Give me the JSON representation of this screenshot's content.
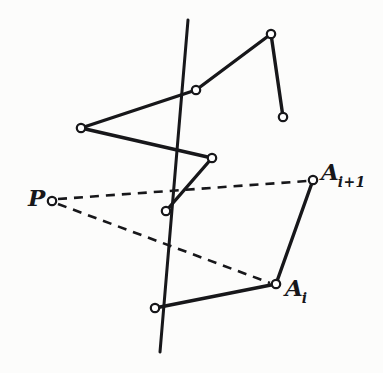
{
  "figure": {
    "kind": "geometric-diagram",
    "title": "",
    "background_color": "#fcfcfb",
    "ink_color": "#17171a",
    "marker_fill_color": "#ffffff",
    "width": 383,
    "height": 373,
    "labels": [
      {
        "id": "P",
        "base": "P",
        "subscript": "",
        "x": 28,
        "y": 186
      },
      {
        "id": "Ai",
        "base": "A",
        "subscript": "i",
        "x": 285,
        "y": 276
      },
      {
        "id": "Ai1",
        "base": "A",
        "subscript": "i+1",
        "x": 321,
        "y": 160
      }
    ],
    "points": [
      {
        "id": "P",
        "label": "P",
        "x": 52,
        "y": 201,
        "marker": "open-circle"
      },
      {
        "id": "V1",
        "label": "",
        "x": 81,
        "y": 128,
        "marker": "open-circle"
      },
      {
        "id": "V2",
        "label": "",
        "x": 196,
        "y": 90,
        "marker": "open-circle"
      },
      {
        "id": "V3",
        "label": "",
        "x": 271,
        "y": 34,
        "marker": "open-circle"
      },
      {
        "id": "V4",
        "label": "",
        "x": 283,
        "y": 117,
        "marker": "open-circle"
      },
      {
        "id": "V5",
        "label": "",
        "x": 212,
        "y": 158,
        "marker": "open-circle"
      },
      {
        "id": "V6",
        "label": "",
        "x": 166,
        "y": 211,
        "marker": "open-circle"
      },
      {
        "id": "V7",
        "label": "",
        "x": 155,
        "y": 308,
        "marker": "open-circle"
      },
      {
        "id": "Ai",
        "label": "A_i",
        "x": 276,
        "y": 284,
        "marker": "open-circle"
      },
      {
        "id": "Ai1",
        "label": "A_i+1",
        "x": 313,
        "y": 180,
        "marker": "open-circle"
      }
    ],
    "solid_polyline_upper": [
      "V4",
      "V3",
      "V2",
      "V1",
      "V5",
      "V6"
    ],
    "solid_polyline_lower": [
      "Ai1",
      "Ai",
      "V7"
    ],
    "straight_line": {
      "id": "cutting-line",
      "x1": 188,
      "y1": 20,
      "x2": 160,
      "y2": 352
    },
    "dashed_rays": [
      {
        "id": "ray-P-Ai1",
        "from": "P",
        "to": "Ai1",
        "x1": 58,
        "y1": 199,
        "x2": 307,
        "y2": 181
      },
      {
        "id": "ray-P-Ai",
        "from": "P",
        "to": "Ai",
        "x1": 58,
        "y1": 204,
        "x2": 270,
        "y2": 283
      }
    ],
    "stroke_widths": {
      "polyline": 3.4,
      "line": 3.0,
      "dashed": 2.6,
      "marker": 2.2
    },
    "dash_pattern": "9 7",
    "marker_radius": 4.2
  }
}
